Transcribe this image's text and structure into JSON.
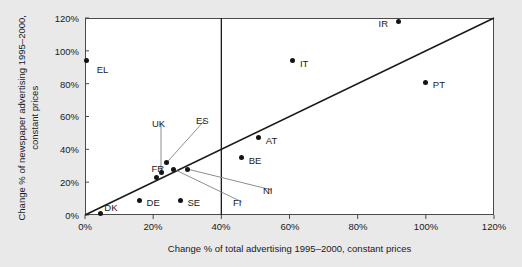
{
  "chart_data": {
    "type": "scatter",
    "title": "",
    "xlabel": "Change % of total advertising 1995–2000, constant prices",
    "ylabel": "Change % of newspaper advertising 1995–2000, constant prices",
    "xlim": [
      0,
      120
    ],
    "ylim": [
      0,
      120
    ],
    "xticks": [
      "0%",
      "20%",
      "40%",
      "60%",
      "80%",
      "100%",
      "120%"
    ],
    "xtick_values": [
      0,
      20,
      40,
      60,
      80,
      100,
      120
    ],
    "yticks": [
      "0%",
      "20%",
      "40%",
      "60%",
      "80%",
      "100%",
      "120%"
    ],
    "ytick_values": [
      0,
      20,
      40,
      60,
      80,
      100,
      120
    ],
    "grid": false,
    "legend": "none",
    "series": [
      {
        "name": "EU countries",
        "points": [
          {
            "label": "EL",
            "x": 0.5,
            "y": 94.0,
            "label_dx": 10,
            "label_dy": 9,
            "callout": false
          },
          {
            "label": "DK",
            "x": 4.5,
            "y": 1.0,
            "label_dx": 4,
            "label_dy": -5,
            "callout": false
          },
          {
            "label": "DE",
            "x": 16.0,
            "y": 9.0,
            "label_dx": 7,
            "label_dy": 3,
            "callout": false
          },
          {
            "label": "SE",
            "x": 28.0,
            "y": 9.0,
            "label_dx": 7,
            "label_dy": 3,
            "callout": false
          },
          {
            "label": "FR",
            "x": 21.0,
            "y": 23.0,
            "label_dx": -5,
            "label_dy": -8,
            "callout": false
          },
          {
            "label": "UK",
            "x": 22.3,
            "y": 26.0,
            "callout": true,
            "lx": 152,
            "ly": 119
          },
          {
            "label": "ES",
            "x": 24.0,
            "y": 32.0,
            "callout": true,
            "lx": 196,
            "ly": 116
          },
          {
            "label": "FI",
            "x": 26.0,
            "y": 28.0,
            "callout": true,
            "lx": 233,
            "ly": 198
          },
          {
            "label": "NI",
            "x": 30.0,
            "y": 28.0,
            "callout": true,
            "lx": 263,
            "ly": 186
          },
          {
            "label": "BE",
            "x": 46.0,
            "y": 35.0,
            "label_dx": 7,
            "label_dy": 3,
            "callout": false
          },
          {
            "label": "AT",
            "x": 51.0,
            "y": 47.0,
            "label_dx": 7,
            "label_dy": 3,
            "callout": false
          },
          {
            "label": "IT",
            "x": 61.0,
            "y": 94.0,
            "label_dx": 7,
            "label_dy": 3,
            "callout": false
          },
          {
            "label": "PT",
            "x": 100.0,
            "y": 81.0,
            "label_dx": 7,
            "label_dy": 3,
            "callout": false
          },
          {
            "label": "IR",
            "x": 92.0,
            "y": 118.0,
            "label_dx": -20,
            "label_dy": 3,
            "callout": false
          }
        ]
      }
    ],
    "reference_lines": [
      {
        "name": "diagonal-parity-line",
        "type": "diagonal",
        "from": [
          0,
          0
        ],
        "to": [
          120,
          120
        ]
      },
      {
        "name": "vertical-40-percent-line",
        "type": "vertical",
        "x": 40
      }
    ],
    "colors": {
      "marker": "#141414",
      "frame": "#4a4a4a",
      "reference_line": "#1a1a1a",
      "leader_line": "#808080",
      "plot_background": "#ffffff",
      "page_background": "#e9e9e9",
      "text": "#1a1a1a"
    }
  }
}
